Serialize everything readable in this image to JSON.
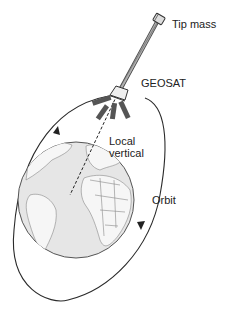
{
  "diagram": {
    "labels": {
      "tip_mass": "Tip mass",
      "satellite": "GEOSAT",
      "local_vertical_1": "Local",
      "local_vertical_2": "vertical",
      "orbit": "Orbit"
    },
    "colors": {
      "line": "#2a2a2a",
      "globe_fill": "#e4e4e4",
      "land": "#f4f4f4",
      "boom": "#8a8a8a",
      "panel": "#555555"
    }
  }
}
